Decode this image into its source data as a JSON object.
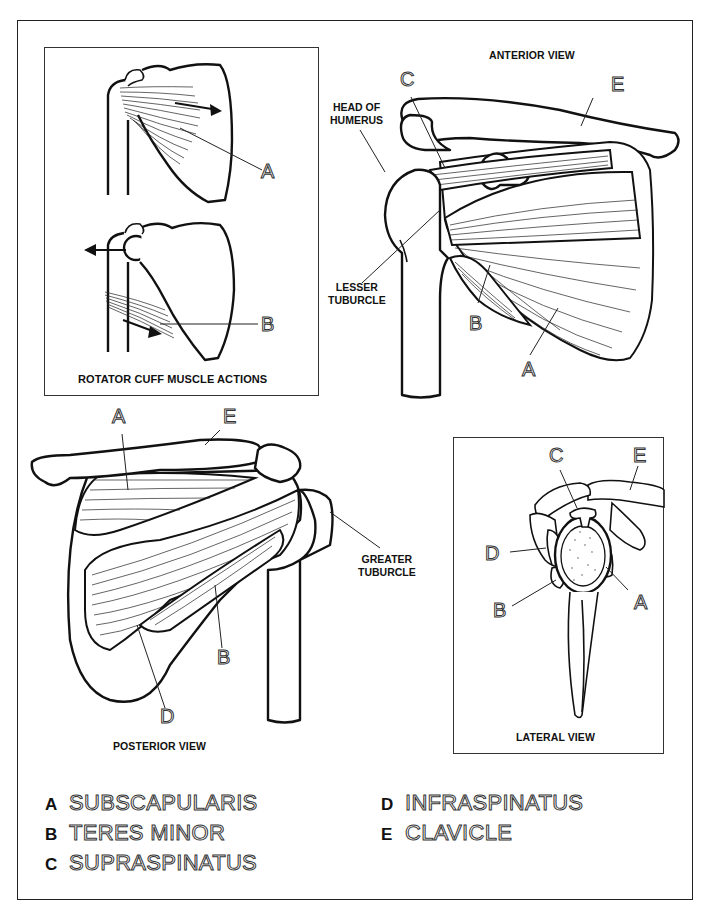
{
  "panels": {
    "actions": {
      "caption": "ROTATOR CUFF MUSCLE ACTIONS",
      "labels": [
        "A",
        "B"
      ]
    },
    "anterior": {
      "caption": "ANTERIOR VIEW",
      "head_of_humerus": "HEAD OF\nHUMERUS",
      "head_line1": "HEAD OF",
      "head_line2": "HUMERUS",
      "lesser_line1": "LESSER",
      "lesser_line2": "TUBURCLE",
      "labels": [
        "C",
        "E",
        "B",
        "A"
      ]
    },
    "posterior": {
      "caption": "POSTERIOR VIEW",
      "greater_line1": "GREATER",
      "greater_line2": "TUBURCLE",
      "labels": [
        "A",
        "E",
        "B",
        "D"
      ]
    },
    "lateral": {
      "caption": "LATERAL VIEW",
      "labels": [
        "C",
        "E",
        "D",
        "B",
        "A"
      ]
    }
  },
  "legend": [
    {
      "key": "A",
      "term": "SUBSCAPULARIS"
    },
    {
      "key": "B",
      "term": "TERES MINOR"
    },
    {
      "key": "C",
      "term": "SUPRASPINATUS"
    },
    {
      "key": "D",
      "term": "INFRASPINATUS"
    },
    {
      "key": "E",
      "term": "CLAVICLE"
    }
  ],
  "colors": {
    "line": "#111111",
    "background": "#ffffff",
    "outline_text_stroke": "#333333"
  }
}
